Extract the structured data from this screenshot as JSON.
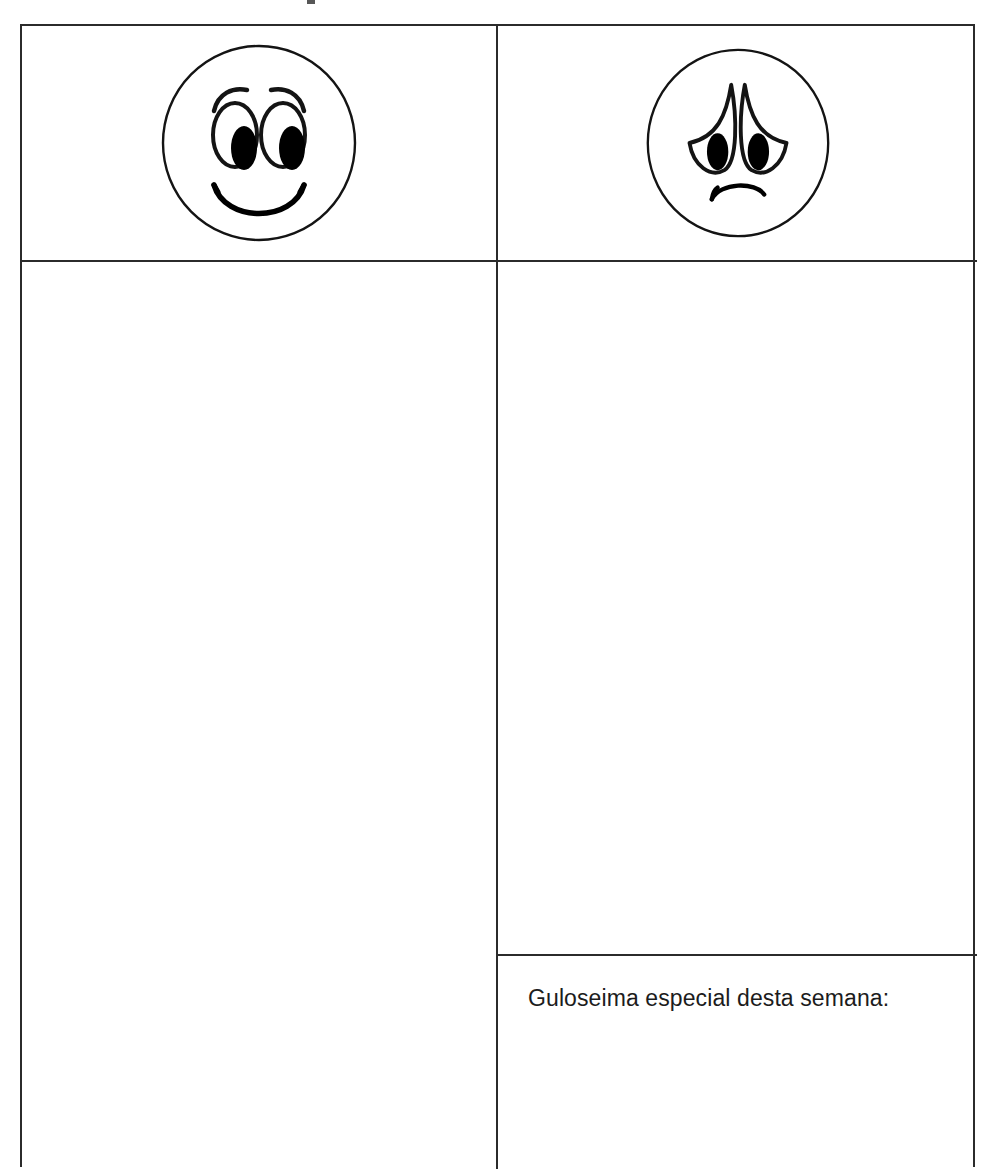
{
  "document": {
    "type": "worksheet-table",
    "language": "pt",
    "orientation": "portrait"
  },
  "table": {
    "columns": 2,
    "border_color": "#2b2b2b",
    "background_color": "#ffffff",
    "header_row": {
      "left_cell": {
        "icon_name": "happy-face-icon",
        "description": "smiley face"
      },
      "right_cell": {
        "icon_name": "sad-face-icon",
        "description": "frowning face"
      }
    },
    "body_row": {
      "left_cell": {
        "content": ""
      },
      "right_cell": {
        "content": ""
      }
    },
    "treat_row": {
      "right_cell": {
        "label": "Guloseima especial desta semana:",
        "content": ""
      }
    }
  },
  "colors": {
    "ink": "#1c1c1c",
    "rule": "#2b2b2b",
    "paper": "#ffffff"
  }
}
